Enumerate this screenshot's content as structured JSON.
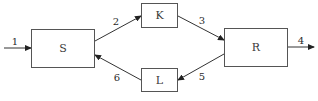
{
  "diagram": {
    "type": "flow-diagram",
    "colors": {
      "stroke": "#555555",
      "text": "#333333",
      "background": "#ffffff"
    },
    "nodes": [
      {
        "id": "S",
        "label": "S"
      },
      {
        "id": "K",
        "label": "K"
      },
      {
        "id": "L",
        "label": "L"
      },
      {
        "id": "R",
        "label": "R"
      }
    ],
    "edges": [
      {
        "id": "1",
        "label": "1",
        "from": "input",
        "to": "S"
      },
      {
        "id": "2",
        "label": "2",
        "from": "S",
        "to": "K"
      },
      {
        "id": "3",
        "label": "3",
        "from": "K",
        "to": "R"
      },
      {
        "id": "4",
        "label": "4",
        "from": "R",
        "to": "output"
      },
      {
        "id": "5",
        "label": "5",
        "from": "R",
        "to": "L"
      },
      {
        "id": "6",
        "label": "6",
        "from": "L",
        "to": "S"
      }
    ]
  }
}
